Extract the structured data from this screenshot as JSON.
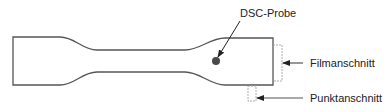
{
  "diagram": {
    "type": "tensile-specimen-schematic",
    "labels": {
      "probe": "DSC-Probe",
      "film_cut": "Filmanschnitt",
      "point_cut": "Punktanschnitt"
    },
    "colors": {
      "outline": "#555555",
      "dot": "#4a4a4a",
      "dashed_box": "#888888",
      "text": "#222222"
    }
  }
}
